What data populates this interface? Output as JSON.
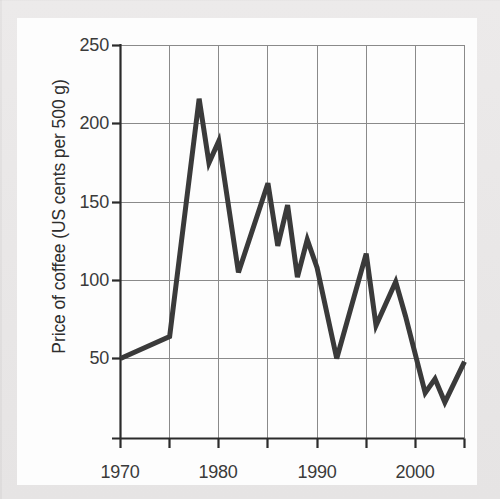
{
  "chart_data": {
    "type": "line",
    "title": "",
    "xlabel": "",
    "ylabel": "Price of coffee (US cents per 500 g)",
    "xlim": [
      1970,
      2005
    ],
    "ylim": [
      0,
      250
    ],
    "grid": true,
    "legend": "none",
    "x_ticks": [
      1970,
      1980,
      1990,
      2000
    ],
    "x_tick_labels": [
      "1970",
      "1980",
      "1990",
      "2000"
    ],
    "x_gridlines": [
      1970,
      1975,
      1980,
      1985,
      1990,
      1995,
      2000,
      2005
    ],
    "y_ticks": [
      50,
      100,
      150,
      200,
      250
    ],
    "y_tick_labels": [
      "50",
      "100",
      "150",
      "200",
      "250"
    ],
    "line_color": "#3a3a3a",
    "line_width": 5,
    "series": [
      {
        "name": "Price of coffee",
        "x": [
          1970,
          1975,
          1978,
          1979,
          1980,
          1982,
          1985,
          1986,
          1987,
          1988,
          1989,
          1990,
          1992,
          1995,
          1996,
          1998,
          1999,
          2001,
          2002,
          2003,
          2005
        ],
        "values": [
          50,
          64,
          216,
          175,
          189,
          105,
          162,
          122,
          148,
          102,
          126,
          108,
          50,
          117,
          71,
          99,
          77,
          28,
          37,
          22,
          48
        ]
      }
    ]
  },
  "axes": {
    "y_title": "Price of coffee (US cents per 500 g)",
    "y_labels": [
      "250",
      "200",
      "150",
      "100",
      "50"
    ],
    "x_labels": [
      "1970",
      "1980",
      "1990",
      "2000"
    ]
  },
  "colors": {
    "line": "#3a3a3a",
    "grid": "#888888",
    "axis": "#2b2b2b",
    "page_background": "#e9e9e9",
    "card_background": "#fdfdfd",
    "text": "#3a3a3a"
  }
}
